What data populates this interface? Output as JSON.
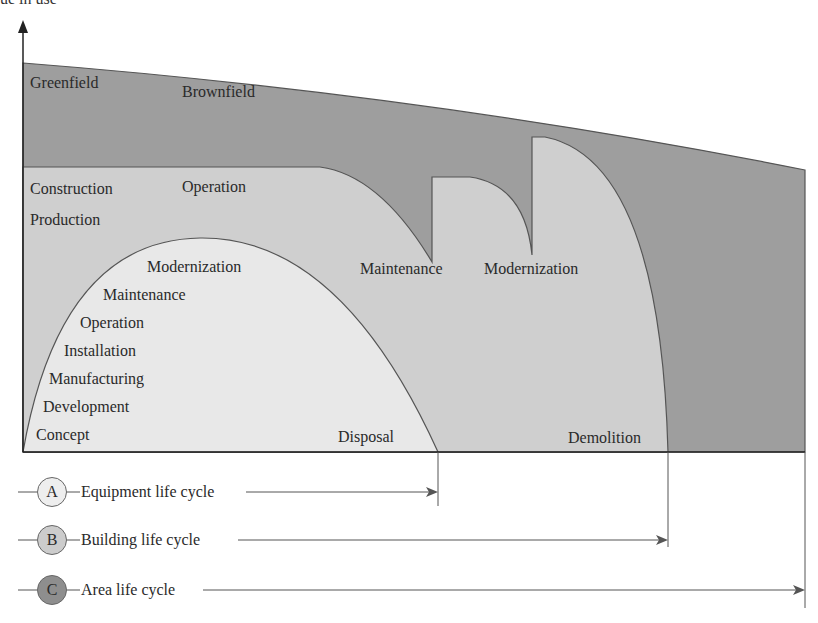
{
  "diagram": {
    "y_axis_label_partial": "ue in use",
    "colors": {
      "area": "#9e9e9e",
      "building": "#cfcfcf",
      "equipment": "#e8e8e8",
      "stroke": "#555555",
      "circle_a": "#eeeeee",
      "circle_b": "#cccccc",
      "circle_c": "#8e8e8e"
    },
    "area_labels": {
      "greenfield": "Greenfield",
      "brownfield": "Brownfield"
    },
    "building_labels": {
      "construction": "Construction",
      "production": "Production",
      "operation": "Operation",
      "maintenance": "Maintenance",
      "modernization": "Modernization",
      "demolition": "Demolition"
    },
    "equipment_labels": {
      "modernization": "Modernization",
      "maintenance": "Maintenance",
      "operation": "Operation",
      "installation": "Installation",
      "manufacturing": "Manufacturing",
      "development": "Development",
      "concept": "Concept",
      "disposal": "Disposal"
    },
    "legend": [
      {
        "letter": "A",
        "label": "Equipment life cycle"
      },
      {
        "letter": "B",
        "label": "Building life cycle"
      },
      {
        "letter": "C",
        "label": "Area life cycle"
      }
    ]
  }
}
